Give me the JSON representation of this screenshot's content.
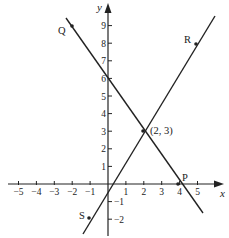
{
  "diagram": {
    "axes": {
      "x_label": "x",
      "y_label": "y",
      "x_ticks": [
        {
          "label": "−5",
          "value": -5
        },
        {
          "label": "−4",
          "value": -4
        },
        {
          "label": "−3",
          "value": -3
        },
        {
          "label": "−2",
          "value": -2
        },
        {
          "label": "−1",
          "value": -1
        },
        {
          "label": "1",
          "value": 1
        },
        {
          "label": "2",
          "value": 2
        },
        {
          "label": "3",
          "value": 3
        },
        {
          "label": "4",
          "value": 4
        },
        {
          "label": "5",
          "value": 5
        }
      ],
      "y_ticks": [
        {
          "label": "−2",
          "value": -2
        },
        {
          "label": "−1",
          "value": -1
        },
        {
          "label": "1",
          "value": 1
        },
        {
          "label": "2",
          "value": 2
        },
        {
          "label": "3",
          "value": 3
        },
        {
          "label": "4",
          "value": 4
        },
        {
          "label": "5",
          "value": 5
        },
        {
          "label": "6",
          "value": 6
        },
        {
          "label": "7",
          "value": 7
        },
        {
          "label": "8",
          "value": 8
        },
        {
          "label": "9",
          "value": 9
        }
      ]
    },
    "lines": [
      {
        "name": "line-QP",
        "equation": "y = 6 - 1.5x",
        "points": [
          "Q",
          "P"
        ]
      },
      {
        "name": "line-SR",
        "equation": "y = 1.5x",
        "points": [
          "S",
          "R"
        ]
      }
    ],
    "points": {
      "Q": {
        "label": "Q",
        "x": -2,
        "y": 9
      },
      "R": {
        "label": "R",
        "x": 5.3,
        "y": 8
      },
      "S": {
        "label": "S",
        "x": -1,
        "y": -1.5
      },
      "P": {
        "label": "P",
        "x": 4,
        "y": 0
      },
      "intersection": {
        "label": "(2, 3)",
        "x": 2,
        "y": 3
      }
    },
    "color": "#222222"
  }
}
